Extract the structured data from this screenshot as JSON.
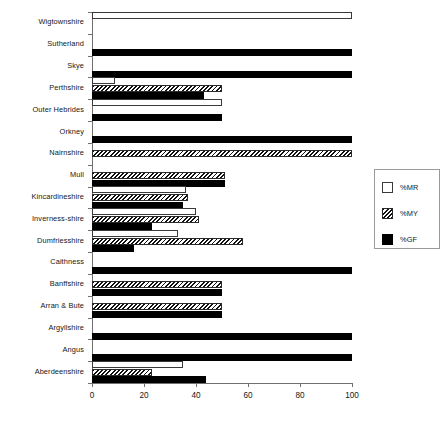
{
  "chart_data": {
    "type": "bar",
    "orientation": "horizontal",
    "title": "",
    "xlabel": "",
    "ylabel": "",
    "xlim": [
      0,
      100
    ],
    "xticks": [
      0,
      20,
      40,
      60,
      80,
      100
    ],
    "xtick_labels": [
      "0",
      "20",
      "40",
      "60",
      "80",
      "100"
    ],
    "grid": false,
    "legend_position": "right",
    "categories": [
      "Wigtownshire",
      "Sutherland",
      "Skye",
      "Perthshire",
      "Outer Hebrides",
      "Orkney",
      "Nairnshire",
      "Mull",
      "Kincardineshire",
      "Inverness-shire",
      "Dumfriesshire",
      "Caithness",
      "Banffshire",
      "Arran & Bute",
      "Argyllshire",
      "Angus",
      "Aberdeenshire"
    ],
    "series": [
      {
        "name": "%MR",
        "fill": "white",
        "values": [
          100,
          0,
          0,
          9,
          50,
          0,
          0,
          0,
          36,
          40,
          33,
          0,
          0,
          0,
          0,
          0,
          35
        ]
      },
      {
        "name": "%MY",
        "fill": "hatch",
        "values": [
          0,
          0,
          0,
          50,
          0,
          0,
          100,
          51,
          37,
          41,
          58,
          0,
          50,
          50,
          0,
          0,
          23
        ]
      },
      {
        "name": "%GF",
        "fill": "black",
        "values": [
          0,
          100,
          100,
          43,
          50,
          100,
          0,
          51,
          35,
          23,
          16,
          100,
          50,
          50,
          100,
          100,
          44
        ]
      }
    ]
  },
  "legend": {
    "entries": [
      {
        "label": "%MR",
        "swatch": "white-square-icon"
      },
      {
        "label": "%MY",
        "swatch": "hatched-square-icon"
      },
      {
        "label": "%GF",
        "swatch": "black-square-icon"
      }
    ]
  }
}
